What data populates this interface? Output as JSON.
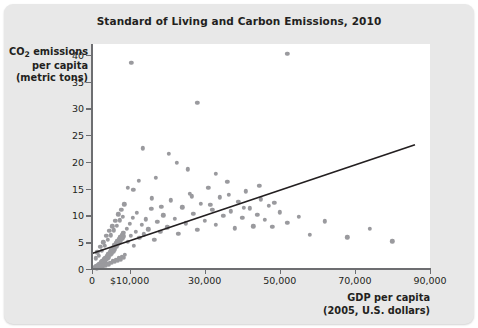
{
  "card": {
    "background_color": "#e8e8e8",
    "plot_background_color": "#ffffff"
  },
  "chart_data": {
    "type": "scatter",
    "title": "Standard of Living and Carbon Emissions, 2010",
    "xlabel_line1": "GDP per capita",
    "xlabel_line2": "(2005, U.S. dollars)",
    "ylabel_line1": "CO",
    "ylabel_sub": "2",
    "ylabel_line1_rest": " emissions",
    "ylabel_line2": "per capita",
    "ylabel_line3": "(metric tons)",
    "xlim": [
      0,
      90000
    ],
    "ylim": [
      0,
      42
    ],
    "grid": false,
    "legend": "none",
    "point_color": "#9a9a9e",
    "trend_line_color": "#231f20",
    "x_ticks": [
      0,
      10000,
      30000,
      50000,
      70000,
      90000
    ],
    "x_tick_labels": [
      "0",
      "$10,000",
      "30,000",
      "50,000",
      "70,000",
      "90,000"
    ],
    "y_ticks": [
      0,
      5,
      10,
      15,
      20,
      25,
      30,
      35,
      40
    ],
    "y_tick_labels": [
      "0",
      "5",
      "10",
      "15",
      "20",
      "25",
      "30",
      "35",
      "40"
    ],
    "trend_line": {
      "x_start": 0,
      "y_start": 2.9,
      "x_end": 86000,
      "y_end": 23.2
    },
    "points": [
      [
        700,
        0.3
      ],
      [
        900,
        0.2
      ],
      [
        1100,
        0.5
      ],
      [
        1300,
        0.4
      ],
      [
        1500,
        0.8
      ],
      [
        1700,
        0.6
      ],
      [
        1900,
        1.0
      ],
      [
        2100,
        0.7
      ],
      [
        2300,
        1.3
      ],
      [
        2500,
        0.9
      ],
      [
        2700,
        1.5
      ],
      [
        2900,
        1.1
      ],
      [
        3100,
        1.8
      ],
      [
        3300,
        1.4
      ],
      [
        3500,
        2.1
      ],
      [
        3700,
        1.6
      ],
      [
        3900,
        2.4
      ],
      [
        4100,
        1.9
      ],
      [
        4300,
        2.8
      ],
      [
        4500,
        2.2
      ],
      [
        4700,
        3.2
      ],
      [
        4900,
        2.6
      ],
      [
        5100,
        3.6
      ],
      [
        5300,
        2.9
      ],
      [
        5500,
        4.0
      ],
      [
        5700,
        3.3
      ],
      [
        5900,
        4.4
      ],
      [
        6100,
        3.7
      ],
      [
        6300,
        4.8
      ],
      [
        6500,
        4.1
      ],
      [
        6700,
        5.2
      ],
      [
        6900,
        4.5
      ],
      [
        7100,
        5.6
      ],
      [
        7300,
        4.9
      ],
      [
        7500,
        6.0
      ],
      [
        7700,
        5.3
      ],
      [
        7900,
        6.4
      ],
      [
        8100,
        5.7
      ],
      [
        8300,
        6.8
      ],
      [
        8500,
        6.1
      ],
      [
        1000,
        2.0
      ],
      [
        1400,
        3.1
      ],
      [
        1800,
        2.5
      ],
      [
        2200,
        4.2
      ],
      [
        2600,
        3.4
      ],
      [
        3000,
        5.0
      ],
      [
        3400,
        4.3
      ],
      [
        3800,
        6.2
      ],
      [
        4200,
        5.4
      ],
      [
        4600,
        7.1
      ],
      [
        5000,
        6.3
      ],
      [
        5400,
        8.0
      ],
      [
        5800,
        7.2
      ],
      [
        6200,
        9.0
      ],
      [
        6600,
        8.1
      ],
      [
        7000,
        10.2
      ],
      [
        7400,
        9.1
      ],
      [
        7800,
        11.0
      ],
      [
        8200,
        9.8
      ],
      [
        8600,
        12.1
      ],
      [
        1200,
        0.1
      ],
      [
        1600,
        0.3
      ],
      [
        2000,
        0.2
      ],
      [
        2400,
        0.5
      ],
      [
        2800,
        0.4
      ],
      [
        3200,
        0.7
      ],
      [
        3600,
        0.6
      ],
      [
        4000,
        1.0
      ],
      [
        4400,
        0.8
      ],
      [
        4800,
        1.2
      ],
      [
        5200,
        1.1
      ],
      [
        5600,
        1.5
      ],
      [
        6000,
        1.3
      ],
      [
        6400,
        1.7
      ],
      [
        6800,
        1.6
      ],
      [
        7200,
        2.0
      ],
      [
        7600,
        1.8
      ],
      [
        8000,
        2.3
      ],
      [
        8400,
        2.1
      ],
      [
        8800,
        2.6
      ],
      [
        9200,
        7.5
      ],
      [
        9600,
        5.1
      ],
      [
        10000,
        8.4
      ],
      [
        10400,
        6.2
      ],
      [
        10800,
        9.6
      ],
      [
        11200,
        4.3
      ],
      [
        11600,
        7.0
      ],
      [
        12000,
        10.5
      ],
      [
        12600,
        5.8
      ],
      [
        13200,
        8.2
      ],
      [
        13800,
        6.5
      ],
      [
        14400,
        9.3
      ],
      [
        15000,
        7.4
      ],
      [
        15800,
        11.2
      ],
      [
        16600,
        5.5
      ],
      [
        17400,
        8.8
      ],
      [
        18200,
        6.9
      ],
      [
        19000,
        10.0
      ],
      [
        20000,
        7.8
      ],
      [
        21000,
        12.8
      ],
      [
        22000,
        9.4
      ],
      [
        23000,
        6.6
      ],
      [
        24000,
        11.5
      ],
      [
        25000,
        8.5
      ],
      [
        26000,
        14.0
      ],
      [
        27000,
        10.3
      ],
      [
        28000,
        7.3
      ],
      [
        29000,
        12.2
      ],
      [
        30000,
        9.0
      ],
      [
        31000,
        15.1
      ],
      [
        32000,
        11.0
      ],
      [
        33000,
        8.2
      ],
      [
        34000,
        13.4
      ],
      [
        35000,
        9.9
      ],
      [
        36000,
        16.3
      ],
      [
        37000,
        10.8
      ],
      [
        38000,
        7.6
      ],
      [
        39000,
        12.6
      ],
      [
        40000,
        9.5
      ],
      [
        41000,
        14.5
      ],
      [
        42000,
        11.3
      ],
      [
        43000,
        8.0
      ],
      [
        44000,
        10.1
      ],
      [
        45000,
        13.0
      ],
      [
        46000,
        9.2
      ],
      [
        47000,
        11.8
      ],
      [
        48000,
        7.9
      ],
      [
        50000,
        10.6
      ],
      [
        52000,
        8.6
      ],
      [
        55000,
        9.7
      ],
      [
        58000,
        6.4
      ],
      [
        62000,
        8.9
      ],
      [
        68000,
        5.9
      ],
      [
        74000,
        7.5
      ],
      [
        80000,
        5.2
      ],
      [
        10500,
        38.5
      ],
      [
        52000,
        40.2
      ],
      [
        28000,
        31.0
      ],
      [
        20500,
        21.5
      ],
      [
        22500,
        19.8
      ],
      [
        13500,
        22.5
      ],
      [
        12500,
        16.5
      ],
      [
        11000,
        14.8
      ],
      [
        9500,
        15.2
      ],
      [
        17000,
        17.0
      ],
      [
        25500,
        18.6
      ],
      [
        33000,
        17.8
      ],
      [
        36500,
        13.8
      ],
      [
        44500,
        15.5
      ],
      [
        31500,
        12.0
      ],
      [
        16000,
        13.2
      ],
      [
        18500,
        11.6
      ],
      [
        26500,
        13.6
      ],
      [
        40500,
        11.4
      ],
      [
        48500,
        12.4
      ]
    ]
  }
}
